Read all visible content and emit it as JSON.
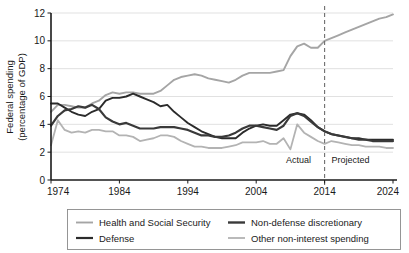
{
  "chart_data": {
    "type": "line",
    "title": "",
    "xlabel": "",
    "ylabel": "Federal spending (percentage of GDP)",
    "ylabel_line1": "Federal spending",
    "ylabel_line2": "(percentage of GDP)",
    "xlim": [
      1974,
      2024
    ],
    "ylim": [
      0,
      12
    ],
    "ytick_values": [
      0,
      2,
      4,
      6,
      8,
      10,
      12
    ],
    "ytick_labels": [
      "0",
      "2",
      "4",
      "6",
      "8",
      "10",
      "12"
    ],
    "xtick_values": [
      1974,
      1984,
      1994,
      2004,
      2014,
      2024
    ],
    "xtick_labels": [
      "1974",
      "1984",
      "1994",
      "2004",
      "2014",
      "2024"
    ],
    "grid": "horizontal",
    "legend_position": "bottom",
    "annotations": [
      {
        "name": "actual-label",
        "text": "Actual",
        "x": 2012,
        "y": 1.2,
        "align": "right"
      },
      {
        "name": "projected-label",
        "text": "Projected",
        "x": 2015,
        "y": 1.2,
        "align": "left"
      }
    ],
    "divider": {
      "name": "actual-projected-divider",
      "x": 2014,
      "style": "dashed",
      "color": "#6e6e6e"
    },
    "colors": {
      "health_and_social_security": "#a5a5a5",
      "defense": "#2b2b2b",
      "non_defense_discretionary": "#3a3a3a",
      "other_non_interest_spending": "#b3b3b3"
    },
    "series": [
      {
        "name": "Health and Social Security",
        "color": "#a5a5a5",
        "width": 1.9,
        "x": [
          1974,
          1975,
          1976,
          1977,
          1978,
          1979,
          1980,
          1981,
          1982,
          1983,
          1984,
          1985,
          1986,
          1987,
          1988,
          1989,
          1990,
          1991,
          1992,
          1993,
          1994,
          1995,
          1996,
          1997,
          1998,
          1999,
          2000,
          2001,
          2002,
          2003,
          2004,
          2005,
          2006,
          2007,
          2008,
          2009,
          2010,
          2011,
          2012,
          2013,
          2014,
          2015,
          2016,
          2017,
          2018,
          2019,
          2020,
          2021,
          2022,
          2023,
          2024
        ],
        "values": [
          4.9,
          5.4,
          5.4,
          5.3,
          5.2,
          5.2,
          5.5,
          5.7,
          6.1,
          6.3,
          6.2,
          6.3,
          6.3,
          6.2,
          6.2,
          6.2,
          6.4,
          6.8,
          7.2,
          7.4,
          7.5,
          7.6,
          7.5,
          7.3,
          7.2,
          7.1,
          7.0,
          7.2,
          7.5,
          7.7,
          7.7,
          7.7,
          7.7,
          7.8,
          7.9,
          8.9,
          9.6,
          9.8,
          9.5,
          9.5,
          10.0,
          10.2,
          10.4,
          10.6,
          10.8,
          11.0,
          11.2,
          11.4,
          11.6,
          11.7,
          11.9
        ]
      },
      {
        "name": "Defense",
        "color": "#2b2b2b",
        "width": 1.9,
        "x": [
          1974,
          1975,
          1976,
          1977,
          1978,
          1979,
          1980,
          1981,
          1982,
          1983,
          1984,
          1985,
          1986,
          1987,
          1988,
          1989,
          1990,
          1991,
          1992,
          1993,
          1994,
          1995,
          1996,
          1997,
          1998,
          1999,
          2000,
          2001,
          2002,
          2003,
          2004,
          2005,
          2006,
          2007,
          2008,
          2009,
          2010,
          2011,
          2012,
          2013,
          2014,
          2015,
          2016,
          2017,
          2018,
          2019,
          2020,
          2021,
          2022,
          2023,
          2024
        ],
        "values": [
          5.5,
          5.5,
          5.2,
          4.9,
          4.7,
          4.6,
          4.9,
          5.1,
          5.7,
          5.9,
          5.9,
          6.0,
          6.2,
          6.0,
          5.8,
          5.6,
          5.3,
          5.4,
          4.9,
          4.5,
          4.1,
          3.8,
          3.5,
          3.3,
          3.1,
          3.0,
          3.0,
          3.0,
          3.4,
          3.7,
          3.9,
          4.0,
          3.9,
          3.9,
          4.3,
          4.7,
          4.8,
          4.7,
          4.3,
          3.8,
          3.5,
          3.3,
          3.2,
          3.1,
          3.0,
          3.0,
          2.9,
          2.9,
          2.9,
          2.9,
          2.9
        ]
      },
      {
        "name": "Non-defense discretionary",
        "color": "#3a3a3a",
        "width": 2.2,
        "x": [
          1974,
          1975,
          1976,
          1977,
          1978,
          1979,
          1980,
          1981,
          1982,
          1983,
          1984,
          1985,
          1986,
          1987,
          1988,
          1989,
          1990,
          1991,
          1992,
          1993,
          1994,
          1995,
          1996,
          1997,
          1998,
          1999,
          2000,
          2001,
          2002,
          2003,
          2004,
          2005,
          2006,
          2007,
          2008,
          2009,
          2010,
          2011,
          2012,
          2013,
          2014,
          2015,
          2016,
          2017,
          2018,
          2019,
          2020,
          2021,
          2022,
          2023,
          2024
        ],
        "values": [
          3.9,
          4.6,
          5.0,
          5.1,
          5.3,
          5.2,
          5.4,
          5.1,
          4.5,
          4.2,
          4.0,
          4.1,
          3.9,
          3.7,
          3.7,
          3.7,
          3.8,
          3.8,
          3.8,
          3.7,
          3.6,
          3.4,
          3.2,
          3.2,
          3.1,
          3.1,
          3.2,
          3.4,
          3.7,
          3.9,
          3.9,
          3.8,
          3.7,
          3.6,
          3.9,
          4.6,
          4.8,
          4.6,
          4.2,
          3.8,
          3.5,
          3.3,
          3.2,
          3.1,
          3.0,
          2.9,
          2.9,
          2.8,
          2.8,
          2.8,
          2.8
        ]
      },
      {
        "name": "Other non-interest spending",
        "color": "#b3b3b3",
        "width": 1.8,
        "x": [
          1974,
          1975,
          1976,
          1977,
          1978,
          1979,
          1980,
          1981,
          1982,
          1983,
          1984,
          1985,
          1986,
          1987,
          1988,
          1989,
          1990,
          1991,
          1992,
          1993,
          1994,
          1995,
          1996,
          1997,
          1998,
          1999,
          2000,
          2001,
          2002,
          2003,
          2004,
          2005,
          2006,
          2007,
          2008,
          2009,
          2010,
          2011,
          2012,
          2013,
          2014,
          2015,
          2016,
          2017,
          2018,
          2019,
          2020,
          2021,
          2022,
          2023,
          2024
        ],
        "values": [
          2.5,
          4.3,
          3.6,
          3.4,
          3.5,
          3.4,
          3.6,
          3.6,
          3.5,
          3.5,
          3.2,
          3.2,
          3.1,
          2.8,
          2.9,
          3.0,
          3.2,
          3.2,
          3.1,
          2.8,
          2.6,
          2.4,
          2.4,
          2.3,
          2.3,
          2.3,
          2.4,
          2.5,
          2.7,
          2.7,
          2.7,
          2.8,
          2.6,
          2.6,
          3.0,
          2.2,
          4.0,
          3.4,
          3.1,
          2.8,
          2.6,
          2.8,
          2.7,
          2.6,
          2.5,
          2.5,
          2.4,
          2.4,
          2.4,
          2.3,
          2.3
        ]
      }
    ]
  },
  "legend": {
    "items": [
      {
        "label": "Health and Social Security",
        "color": "#a5a5a5",
        "width": 1.9
      },
      {
        "label": "Non-defense discretionary",
        "color": "#3a3a3a",
        "width": 2.4
      },
      {
        "label": "Defense",
        "color": "#2b2b2b",
        "width": 2.2
      },
      {
        "label": "Other non-interest spending",
        "color": "#b3b3b3",
        "width": 1.8
      }
    ]
  }
}
